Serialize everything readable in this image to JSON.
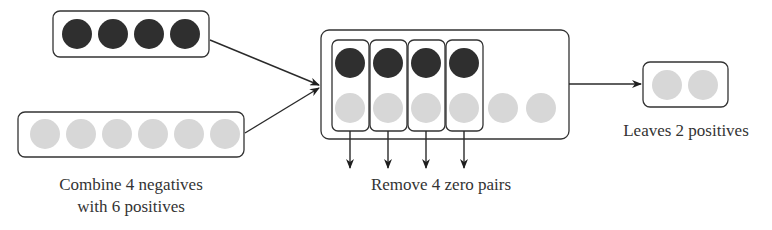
{
  "diagram": {
    "colors": {
      "negative": "#2f2f2f",
      "positive": "#d7d7d7",
      "stroke": "#333333",
      "text": "#333333"
    },
    "groups": {
      "negatives": {
        "count": 4,
        "type": "negative"
      },
      "positives": {
        "count": 6,
        "type": "positive"
      },
      "combined": {
        "zero_pairs": 4,
        "remaining_positives": 2
      },
      "result": {
        "count": 2,
        "type": "positive"
      }
    },
    "labels": {
      "combine_line1": "Combine 4 negatives",
      "combine_line2": "with 6 positives",
      "remove": "Remove 4 zero pairs",
      "leaves": "Leaves 2 positives"
    }
  }
}
